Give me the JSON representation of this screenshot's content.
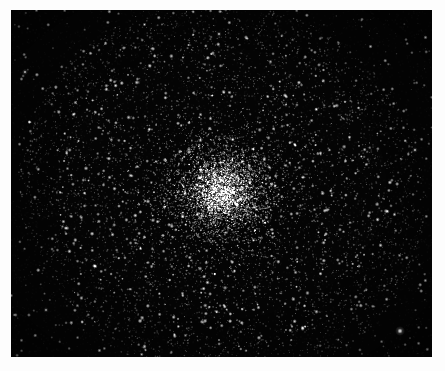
{
  "image": {
    "title": "Globular Cluster",
    "subject": "globular star cluster",
    "medium": "grayscale astronomical photograph",
    "caption": "",
    "border_color": "#fdfdfd",
    "sky_color": "#040404",
    "star_color": "#ffffff",
    "core_glow_color": "#ffffff",
    "width": 445,
    "height": 371
  },
  "plate": {
    "left": 11,
    "top": 10,
    "width": 421,
    "height": 347
  },
  "chart_data": {
    "type": "scatter",
    "xlabel": "",
    "ylabel": "",
    "xlim": [
      0,
      421
    ],
    "ylim": [
      0,
      347
    ],
    "grid": false,
    "legend": null,
    "background": "#040404",
    "point_color": "#ffffff",
    "cluster": {
      "center_x": 211,
      "center_y": 182,
      "core_radius": 34,
      "half_light_radius": 72,
      "tidal_radius": 205,
      "core_star_count": 5200,
      "halo_star_count": 4200,
      "field_star_count": 900,
      "total_points": 10300,
      "ellipticity": 0.08,
      "position_angle_deg": 18
    },
    "surface_brightness_profile": {
      "radius_px": [
        0,
        10,
        20,
        30,
        45,
        60,
        80,
        100,
        130,
        160,
        200
      ],
      "relative_intensity": [
        1.0,
        0.94,
        0.78,
        0.6,
        0.4,
        0.27,
        0.16,
        0.09,
        0.04,
        0.018,
        0.005
      ]
    },
    "notable_points": [
      {
        "name": "bright-field-star-lower-right",
        "x": 389,
        "y": 321,
        "brightness": 1.0,
        "radius_px": 2.6
      },
      {
        "name": "field-star-upper-left",
        "x": 14,
        "y": 62,
        "brightness": 0.85,
        "radius_px": 1.6
      },
      {
        "name": "field-star-right-edge",
        "x": 404,
        "y": 140,
        "brightness": 0.8,
        "radius_px": 1.5
      },
      {
        "name": "field-star-lower-left",
        "x": 35,
        "y": 300,
        "brightness": 0.75,
        "radius_px": 1.4
      },
      {
        "name": "field-star-top",
        "x": 208,
        "y": 24,
        "brightness": 0.78,
        "radius_px": 1.4
      }
    ]
  }
}
